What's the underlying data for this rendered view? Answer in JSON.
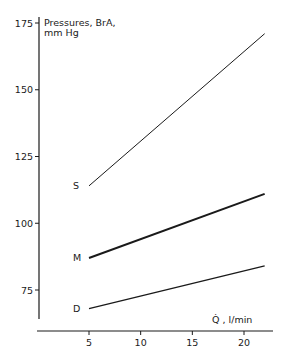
{
  "chart_data": {
    "type": "line",
    "title": "",
    "ylabel": "Pressures, BrA, mm Hg",
    "ylabel_lines": [
      "Pressures, BrA,",
      "mm Hg"
    ],
    "xlabel": "Q̇ , l/min",
    "ylim": [
      63,
      176
    ],
    "xlim": [
      0,
      23
    ],
    "yticks": [
      75,
      100,
      125,
      150,
      175
    ],
    "ytick_labels": [
      "75",
      "100",
      "125",
      "150",
      "175"
    ],
    "xticks": [
      5,
      10,
      15,
      20
    ],
    "xtick_labels": [
      "5",
      "10",
      "15",
      "20"
    ],
    "grid": false,
    "legend": "inline labels at left end of each line",
    "series": [
      {
        "name": "S",
        "label": "S",
        "x": [
          5,
          22
        ],
        "values": [
          114,
          171
        ],
        "stroke_width": 1.0
      },
      {
        "name": "M",
        "label": "M",
        "x": [
          5,
          22
        ],
        "values": [
          87,
          111
        ],
        "stroke_width": 2.0
      },
      {
        "name": "D",
        "label": "D",
        "x": [
          5,
          22
        ],
        "values": [
          68,
          84
        ],
        "stroke_width": 1.3
      }
    ]
  }
}
